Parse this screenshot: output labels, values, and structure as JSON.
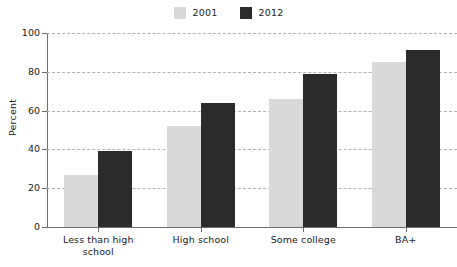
{
  "chart_data": {
    "type": "bar",
    "title": "",
    "subtitle": "",
    "xlabel": "",
    "ylabel": "Percent",
    "ylim": [
      0,
      100
    ],
    "yticks": [
      0,
      20,
      40,
      60,
      80,
      100
    ],
    "grid": true,
    "legend_position": "top-center",
    "categories": [
      "Less than high school",
      "High school",
      "Some college",
      "BA+"
    ],
    "category_lines": [
      [
        "Less than high",
        "school"
      ],
      [
        "High school"
      ],
      [
        "Some college"
      ],
      [
        "BA+"
      ]
    ],
    "series": [
      {
        "name": "2001",
        "color": "#d9d9d9",
        "values": [
          27,
          52,
          66,
          85
        ]
      },
      {
        "name": "2012",
        "color": "#2b2b2b",
        "values": [
          39,
          64,
          79,
          91
        ]
      }
    ]
  },
  "legend": {
    "entries": [
      {
        "label": "2001",
        "color": "#d9d9d9"
      },
      {
        "label": "2012",
        "color": "#2b2b2b"
      }
    ]
  },
  "axes": {
    "y_title": "Percent",
    "y_tick_labels": [
      "100",
      "80",
      "60",
      "40",
      "20",
      "0"
    ],
    "x_tick_labels": [
      {
        "line1": "Less than high",
        "line2": "school"
      },
      {
        "line1": "High school",
        "line2": ""
      },
      {
        "line1": "Some college",
        "line2": ""
      },
      {
        "line1": "BA+",
        "line2": ""
      }
    ]
  },
  "colors": {
    "series_2001": "#d9d9d9",
    "series_2012": "#2b2b2b",
    "gridline": "#b2b2b2",
    "axis": "#6e6e6e",
    "text": "#1a1a1a",
    "background": "#ffffff"
  }
}
